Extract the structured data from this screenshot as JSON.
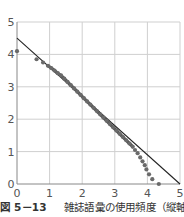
{
  "chart_data": {
    "type": "scatter",
    "title": "",
    "xlabel": "",
    "ylabel": "",
    "xlim": [
      0,
      5
    ],
    "ylim": [
      0,
      5
    ],
    "grid": true,
    "x_ticks": [
      "0",
      "1",
      "2",
      "3",
      "4",
      "5"
    ],
    "y_ticks": [
      "0",
      "1",
      "2",
      "3",
      "4",
      "5"
    ],
    "series": [
      {
        "name": "observed",
        "type": "scatter",
        "x": [
          0.0,
          0.6,
          0.8,
          0.95,
          1.05,
          1.15,
          1.25,
          1.35,
          1.45,
          1.55,
          1.65,
          1.75,
          1.85,
          1.95,
          2.05,
          2.15,
          2.25,
          2.35,
          2.45,
          2.55,
          2.65,
          2.75,
          2.85,
          2.95,
          3.05,
          3.15,
          3.25,
          3.35,
          3.45,
          3.55,
          3.62,
          3.7,
          3.78,
          3.85,
          3.92,
          3.97,
          4.05,
          4.15,
          4.35
        ],
        "y": [
          4.1,
          3.85,
          3.75,
          3.65,
          3.58,
          3.5,
          3.42,
          3.35,
          3.25,
          3.15,
          3.05,
          2.95,
          2.85,
          2.75,
          2.65,
          2.55,
          2.45,
          2.35,
          2.25,
          2.15,
          2.05,
          1.95,
          1.85,
          1.75,
          1.65,
          1.55,
          1.45,
          1.35,
          1.25,
          1.15,
          1.05,
          0.95,
          0.82,
          0.7,
          0.58,
          0.45,
          0.3,
          0.15,
          0.0
        ]
      },
      {
        "name": "reference line",
        "type": "line",
        "x": [
          0,
          5
        ],
        "y": [
          4.5,
          0
        ]
      }
    ]
  },
  "caption": {
    "figure_label": "図 5－13",
    "text": "雑誌語彙の使用頻度（縦軸）と"
  }
}
